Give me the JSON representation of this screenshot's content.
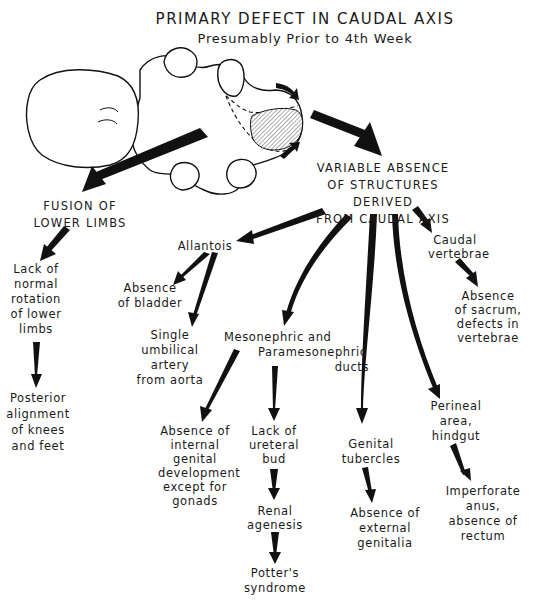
{
  "header": {
    "title": "PRIMARY DEFECT IN CAUDAL AXIS",
    "subtitle": "Presumably Prior to 4th Week"
  },
  "illustration": {
    "subject": "embryo-caudal-axis",
    "hatched_region": "caudal-axis-defect"
  },
  "nodes": {
    "fusion_lower_limbs": "FUSION OF\nLOWER LIMBS",
    "variable_absence": "VARIABLE ABSENCE\nOF STRUCTURES DERIVED\nFROM CAUDAL AXIS",
    "lack_rotation": "Lack of\nnormal\nrotation\nof lower\nlimbs",
    "posterior_alignment": "Posterior\nalignment\nof knees\nand feet",
    "allantois": "Allantois",
    "absence_bladder": "Absence\nof bladder",
    "single_umbilical_artery": "Single\numbilical\nartery\nfrom aorta",
    "mesonephric_ducts": "Mesonephric and\n        Paramesonephric\n                          ducts",
    "absence_internal_genital": "Absence of\ninternal\ngenital\ndevelopment\nexcept for\ngonads",
    "lack_ureteral_bud": "Lack of\nureteral\nbud",
    "renal_agenesis": "Renal\nagenesis",
    "potters_syndrome": "Potter's\nsyndrome",
    "genital_tubercles": "Genital\ntubercles",
    "absence_external_genitalia": "Absence of\nexternal\ngenitalia",
    "caudal_vertebrae": "Caudal\nvertebrae",
    "absence_sacrum": "Absence\nof sacrum,\ndefects in\nvertebrae",
    "perineal_area": "Perineal\narea,\nhindgut",
    "imperforate_anus": "Imperforate\nanus,\nabsence of\nrectum"
  },
  "edges": [
    {
      "from": "illustration",
      "to": "fusion_lower_limbs"
    },
    {
      "from": "illustration",
      "to": "variable_absence"
    },
    {
      "from": "fusion_lower_limbs",
      "to": "lack_rotation"
    },
    {
      "from": "lack_rotation",
      "to": "posterior_alignment"
    },
    {
      "from": "variable_absence",
      "to": "allantois"
    },
    {
      "from": "variable_absence",
      "to": "mesonephric_ducts"
    },
    {
      "from": "variable_absence",
      "to": "genital_tubercles"
    },
    {
      "from": "variable_absence",
      "to": "perineal_area"
    },
    {
      "from": "variable_absence",
      "to": "caudal_vertebrae"
    },
    {
      "from": "allantois",
      "to": "absence_bladder"
    },
    {
      "from": "allantois",
      "to": "single_umbilical_artery"
    },
    {
      "from": "mesonephric_ducts",
      "to": "absence_internal_genital"
    },
    {
      "from": "mesonephric_ducts",
      "to": "lack_ureteral_bud"
    },
    {
      "from": "lack_ureteral_bud",
      "to": "renal_agenesis"
    },
    {
      "from": "renal_agenesis",
      "to": "potters_syndrome"
    },
    {
      "from": "genital_tubercles",
      "to": "absence_external_genitalia"
    },
    {
      "from": "caudal_vertebrae",
      "to": "absence_sacrum"
    },
    {
      "from": "perineal_area",
      "to": "imperforate_anus"
    }
  ],
  "colors": {
    "ink": "#111111",
    "background": "#ffffff"
  }
}
